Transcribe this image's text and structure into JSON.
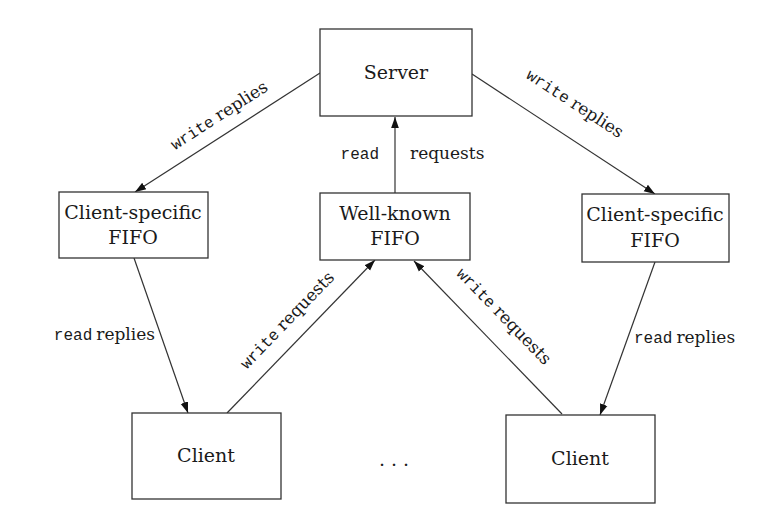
{
  "diagram": {
    "nodes": {
      "server": {
        "label": "Server"
      },
      "left_fifo": {
        "line1": "Client-specific",
        "line2": "FIFO"
      },
      "well_known_fifo": {
        "line1": "Well-known",
        "line2": "FIFO"
      },
      "right_fifo": {
        "line1": "Client-specific",
        "line2": "FIFO"
      },
      "left_client": {
        "label": "Client"
      },
      "right_client": {
        "label": "Client"
      },
      "ellipsis": {
        "label": ". . ."
      }
    },
    "edges": {
      "left_write_replies": {
        "call": "write",
        "text": "replies"
      },
      "right_write_replies": {
        "call": "write",
        "text": "replies"
      },
      "read_requests": {
        "call": "read",
        "text": "requests"
      },
      "left_read_replies": {
        "call": "read",
        "text": "replies"
      },
      "right_read_replies": {
        "call": "read",
        "text": "replies"
      },
      "left_write_requests": {
        "call": "write",
        "text": "requests"
      },
      "right_write_requests": {
        "call": "write",
        "text": "requests"
      }
    },
    "colors": {
      "stroke": "#333333",
      "text": "#1a1a1a",
      "background": "#ffffff"
    }
  }
}
